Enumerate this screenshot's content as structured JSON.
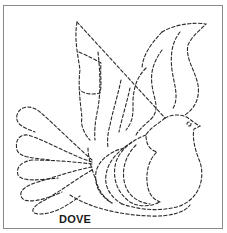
{
  "pattern": {
    "title": "DOVE",
    "subject": "dove quilting stencil",
    "line_style": "dashed",
    "line_color": "#2a2a2a",
    "frame_color": "#8a8a8a",
    "background": "#ffffff"
  }
}
